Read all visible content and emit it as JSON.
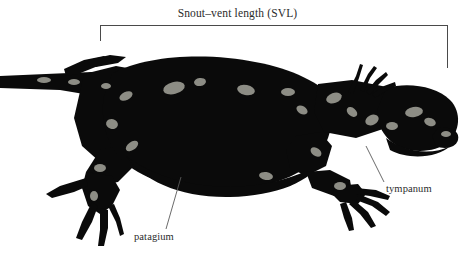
{
  "figure": {
    "background_color": "#ffffff",
    "silhouette_color": "#0a0a0a",
    "line_color": "#4a4a4a",
    "text_color": "#2b2b2b"
  },
  "measurement": {
    "svl_label": "Snout–vent length (SVL)",
    "bracket": {
      "left_x": 100,
      "right_x": 447,
      "top_y": 25,
      "left_drop_y": 41,
      "right_drop_y": 68
    }
  },
  "annotations": [
    {
      "name": "patagium",
      "label": "patagium",
      "label_x": 134,
      "label_y": 232,
      "leader_from_x": 166,
      "leader_from_y": 229,
      "leader_to_x": 181,
      "leader_to_y": 177
    },
    {
      "name": "tympanum",
      "label": "tympanum",
      "label_x": 386,
      "label_y": 184,
      "leader_from_x": 384,
      "leader_from_y": 182,
      "leader_to_x": 366,
      "leader_to_y": 146
    }
  ],
  "specimen": {
    "common_name": "gliding gecko",
    "orientation": "lateral, head to the right, tail to the left",
    "parts": [
      "tail",
      "hind limb",
      "patagium",
      "trunk",
      "fore limb",
      "neck",
      "head",
      "snout",
      "tympanum"
    ]
  }
}
